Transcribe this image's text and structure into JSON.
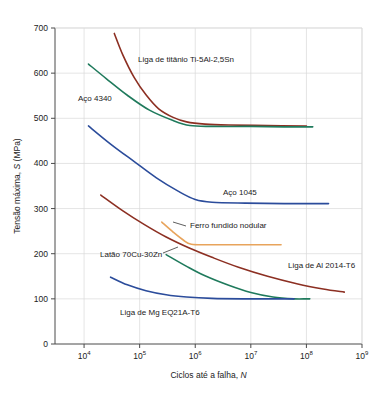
{
  "chart_data": {
    "type": "line",
    "title": "",
    "xlabel": "Ciclos até a falha, N",
    "ylabel": "Tensão máxima, S (MPa)",
    "xscale": "log",
    "xlim": [
      3000,
      1000000000
    ],
    "ylim": [
      0,
      700
    ],
    "grid": true,
    "legend_position": "inline-annotations",
    "xticks": [
      "10⁴",
      "10⁵",
      "10⁶",
      "10⁷",
      "10⁸",
      "10⁹"
    ],
    "xtick_values": [
      10000,
      100000,
      1000000,
      10000000,
      100000000,
      1000000000
    ],
    "xtick_mantissa": [
      "10",
      "10",
      "10",
      "10",
      "10",
      "10"
    ],
    "xtick_exponent": [
      "4",
      "5",
      "6",
      "7",
      "8",
      "9"
    ],
    "yticks": [
      "0",
      "100",
      "200",
      "300",
      "400",
      "500",
      "600",
      "700"
    ],
    "ytick_values": [
      0,
      100,
      200,
      300,
      400,
      500,
      600,
      700
    ],
    "series": [
      {
        "name": "Liga de titânio Ti-5Al-2,5Sn",
        "color": "#8c2f22",
        "label_x": 138,
        "label_y": 62,
        "points": [
          [
            35000,
            688
          ],
          [
            50000,
            640
          ],
          [
            80000,
            590
          ],
          [
            130000,
            552
          ],
          [
            220000,
            521
          ],
          [
            400000,
            502
          ],
          [
            700000,
            492
          ],
          [
            1500000,
            487
          ],
          [
            4000000,
            485
          ],
          [
            20000000,
            484
          ],
          [
            100000000,
            483
          ]
        ]
      },
      {
        "name": "Aço 4340",
        "color": "#1f7a5c",
        "label_x": 78,
        "label_y": 101,
        "points": [
          [
            12000,
            620
          ],
          [
            25000,
            588
          ],
          [
            60000,
            551
          ],
          [
            150000,
            518
          ],
          [
            400000,
            495
          ],
          [
            800000,
            484
          ],
          [
            2000000,
            482
          ],
          [
            10000000,
            482
          ],
          [
            40000000,
            481
          ],
          [
            130000000,
            481
          ]
        ]
      },
      {
        "name": "Aço 1045",
        "color": "#2b4c9b",
        "label_x": 223,
        "label_y": 195,
        "points": [
          [
            12000,
            483
          ],
          [
            30000,
            443
          ],
          [
            80000,
            404
          ],
          [
            200000,
            368
          ],
          [
            500000,
            338
          ],
          [
            1000000,
            320
          ],
          [
            2000000,
            314
          ],
          [
            8000000,
            312
          ],
          [
            40000000,
            311
          ],
          [
            250000000,
            311
          ]
        ]
      },
      {
        "name": "Ferro fundido nodular",
        "color": "#e8a45c",
        "label_x": 190,
        "label_y": 228,
        "points": [
          [
            250000,
            270
          ],
          [
            400000,
            248
          ],
          [
            600000,
            231
          ],
          [
            850000,
            221
          ],
          [
            2000000,
            220
          ],
          [
            10000000,
            220
          ],
          [
            35000000,
            220
          ]
        ]
      },
      {
        "name": "Liga de Al 2014-T6",
        "color": "#8c2f22",
        "label_x": 288,
        "label_y": 268,
        "points": [
          [
            20000,
            330
          ],
          [
            50000,
            295
          ],
          [
            120000,
            265
          ],
          [
            300000,
            237
          ],
          [
            800000,
            212
          ],
          [
            2000000,
            192
          ],
          [
            6000000,
            170
          ],
          [
            20000000,
            150
          ],
          [
            70000000,
            133
          ],
          [
            200000000,
            122
          ],
          [
            480000000,
            115
          ]
        ]
      },
      {
        "name": "Latão 70Cu-30Zn",
        "color": "#1f7a5c",
        "label_x": 100,
        "label_y": 257,
        "points": [
          [
            300000,
            198
          ],
          [
            700000,
            172
          ],
          [
            1500000,
            151
          ],
          [
            4000000,
            130
          ],
          [
            10000000,
            114
          ],
          [
            25000000,
            104
          ],
          [
            60000000,
            100
          ],
          [
            100000000,
            100
          ],
          [
            115000000,
            100
          ]
        ]
      },
      {
        "name": "Liga de Mg EQ21A-T6",
        "color": "#2b4c9b",
        "label_x": 120,
        "label_y": 315,
        "points": [
          [
            30000,
            148
          ],
          [
            60000,
            131
          ],
          [
            130000,
            118
          ],
          [
            300000,
            109
          ],
          [
            700000,
            104
          ],
          [
            2000000,
            101
          ],
          [
            8000000,
            100
          ],
          [
            30000000,
            100
          ],
          [
            60000000,
            100
          ]
        ]
      }
    ],
    "leaders": [
      {
        "name": "latao-leader",
        "x1": 163,
        "y1": 253,
        "x2": 178,
        "y2": 247
      },
      {
        "name": "ferro-leader",
        "x1": 186,
        "y1": 226,
        "x2": 173,
        "y2": 222
      }
    ]
  }
}
